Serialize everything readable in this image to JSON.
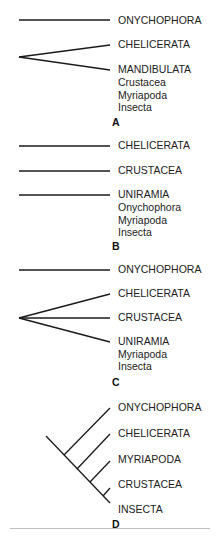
{
  "figure": {
    "panels": [
      {
        "id": "A",
        "label": "A",
        "taxa": [
          "ONYCHOPHORA",
          "CHELICERATA",
          "MANDIBULATA"
        ],
        "subtaxa": [
          "Crustacea",
          "Myriapoda",
          "Insecta"
        ]
      },
      {
        "id": "B",
        "label": "B",
        "taxa": [
          "CHELICERATA",
          "CRUSTACEA",
          "UNIRAMIA"
        ],
        "subtaxa": [
          "Onychophora",
          "Myriapoda",
          "Insecta"
        ]
      },
      {
        "id": "C",
        "label": "C",
        "taxa": [
          "ONYCHOPHORA",
          "CHELICERATA",
          "CRUSTACEA",
          "UNIRAMIA"
        ],
        "subtaxa": [
          "Myriapoda",
          "Insecta"
        ]
      },
      {
        "id": "D",
        "label": "D",
        "taxa": [
          "ONYCHOPHORA",
          "CHELICERATA",
          "MYRIAPODA",
          "CRUSTACEA",
          "INSECTA"
        ]
      }
    ],
    "line_color": "#1a1a1a"
  }
}
